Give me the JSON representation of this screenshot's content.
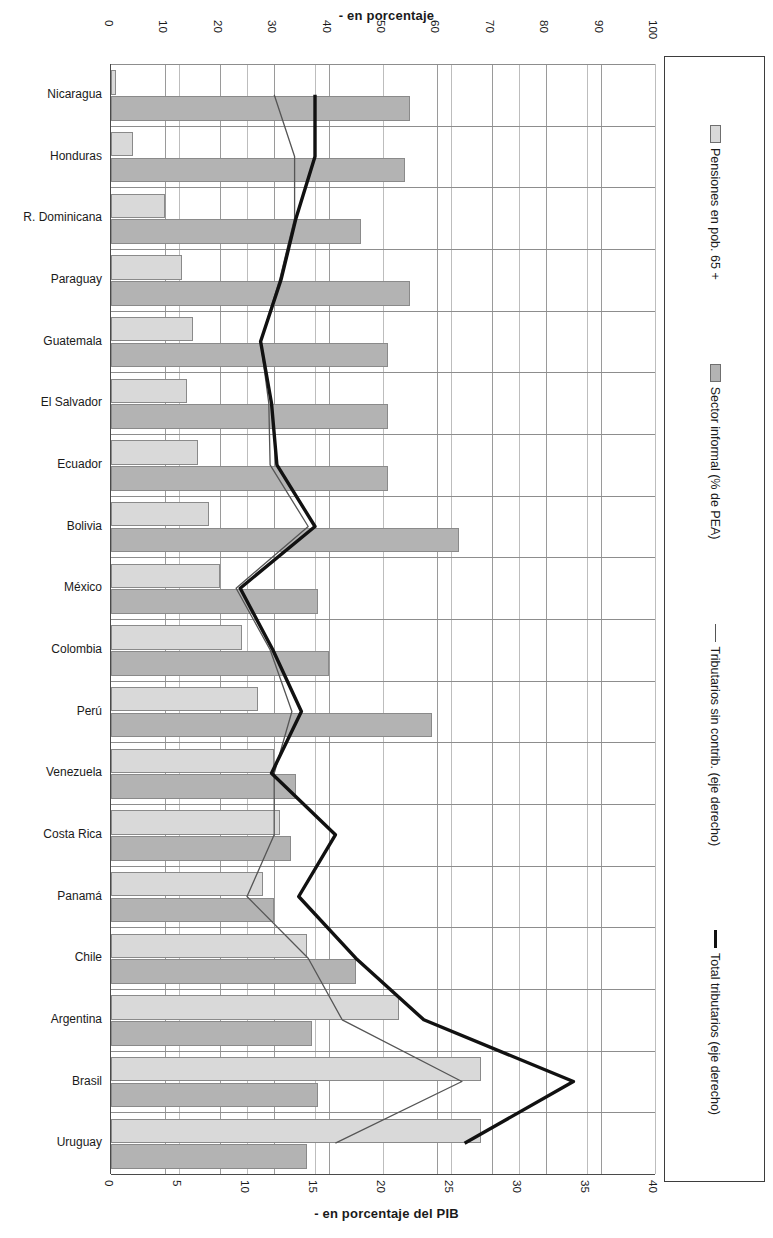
{
  "labels": {
    "top_axis_title": "- en porcentaje",
    "bottom_axis_title": "- en porcentaje  del PIB"
  },
  "legend": {
    "items": [
      {
        "marker": "swatch-light",
        "label": "Pensiones en pob. 65 +"
      },
      {
        "marker": "swatch-dark",
        "label": "Sector informal (% de PEA)"
      },
      {
        "marker": "line-thin",
        "label": "Tributarios sin contrib. (eje derecho)"
      },
      {
        "marker": "line-thick",
        "label": "Total tributarios (eje derecho)"
      }
    ]
  },
  "colors": {
    "bar_light": "#d9d9d9",
    "bar_dark": "#b3b3b3",
    "line_thin": "#555555",
    "line_thick": "#111111",
    "axis": "#4a4a4a",
    "grid": "#9a9a9a"
  },
  "chart_data": {
    "type": "bar",
    "title": "",
    "orientation": "horizontal",
    "grid": true,
    "legend_position": "right",
    "xlabel": "- en porcentaje",
    "xlabel_secondary": "- en porcentaje  del PIB",
    "ylabel": "",
    "xlim": [
      0,
      100
    ],
    "xticks": [
      0,
      10,
      20,
      30,
      40,
      50,
      60,
      70,
      80,
      90,
      100
    ],
    "xlim_secondary": [
      0,
      40
    ],
    "xticks_secondary": [
      0,
      5,
      10,
      15,
      20,
      25,
      30,
      35,
      40
    ],
    "categories": [
      "Nicaragua",
      "Honduras",
      "R. Dominicana",
      "Paraguay",
      "Guatemala",
      "El Salvador",
      "Ecuador",
      "Bolivia",
      "México",
      "Colombia",
      "Perú",
      "Venezuela",
      "Costa Rica",
      "Panamá",
      "Chile",
      "Argentina",
      "Brasil",
      "Uruguay"
    ],
    "series": [
      {
        "name": "Pensiones en pob. 65 +",
        "type": "bar",
        "axis": "top",
        "values": [
          1,
          4,
          10,
          13,
          15,
          14,
          16,
          18,
          20,
          24,
          27,
          30,
          31,
          28,
          36,
          53,
          68,
          68
        ]
      },
      {
        "name": "Sector informal (% de PEA)",
        "type": "bar",
        "axis": "top",
        "values": [
          55,
          54,
          46,
          55,
          51,
          51,
          51,
          64,
          38,
          40,
          59,
          34,
          33,
          30,
          45,
          37,
          38,
          36
        ]
      },
      {
        "name": "Tributarios sin contrib. (eje derecho)",
        "type": "line",
        "axis": "bottom",
        "values": [
          12.0,
          13.5,
          13.5,
          12.4,
          11.0,
          11.6,
          11.7,
          14.5,
          9.2,
          11.7,
          13.3,
          12.0,
          12.0,
          10.0,
          14.5,
          17.0,
          25.8,
          16.5
        ]
      },
      {
        "name": "Total tributarios (eje derecho)",
        "type": "line",
        "axis": "bottom",
        "values": [
          15.0,
          15.0,
          13.6,
          12.5,
          11.0,
          11.8,
          12.2,
          15.0,
          9.5,
          11.9,
          14.0,
          11.8,
          16.5,
          13.8,
          18.0,
          23.0,
          34.0,
          26.0
        ]
      }
    ]
  }
}
